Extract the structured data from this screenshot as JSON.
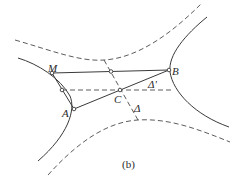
{
  "figure": {
    "caption": "(b)",
    "points": {
      "M": {
        "label": "M"
      },
      "B": {
        "label": "B"
      },
      "A": {
        "label": "A"
      },
      "C": {
        "label": "C"
      }
    },
    "lines": {
      "delta": {
        "label": "Δ"
      },
      "delta_prime": {
        "label": "Δ'"
      }
    },
    "colors": {
      "stroke": "#3a3a3a",
      "background": "#ffffff"
    }
  }
}
